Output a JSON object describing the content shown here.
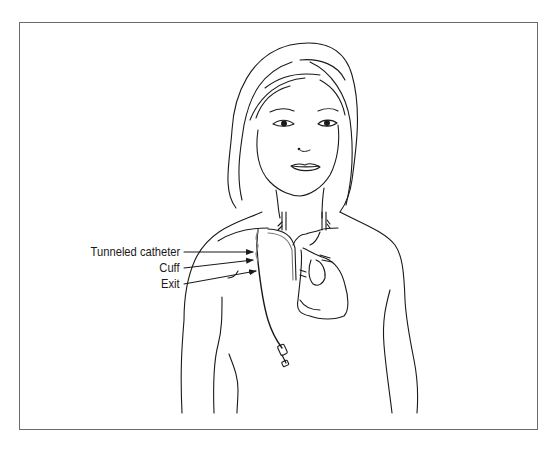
{
  "figure": {
    "line_color": "#1a1a1a",
    "frame_color": "#6a6a6a",
    "labels": [
      {
        "id": "tunneled-catheter",
        "text": "Tunneled catheter"
      },
      {
        "id": "cuff",
        "text": "Cuff"
      },
      {
        "id": "exit",
        "text": "Exit"
      }
    ]
  }
}
